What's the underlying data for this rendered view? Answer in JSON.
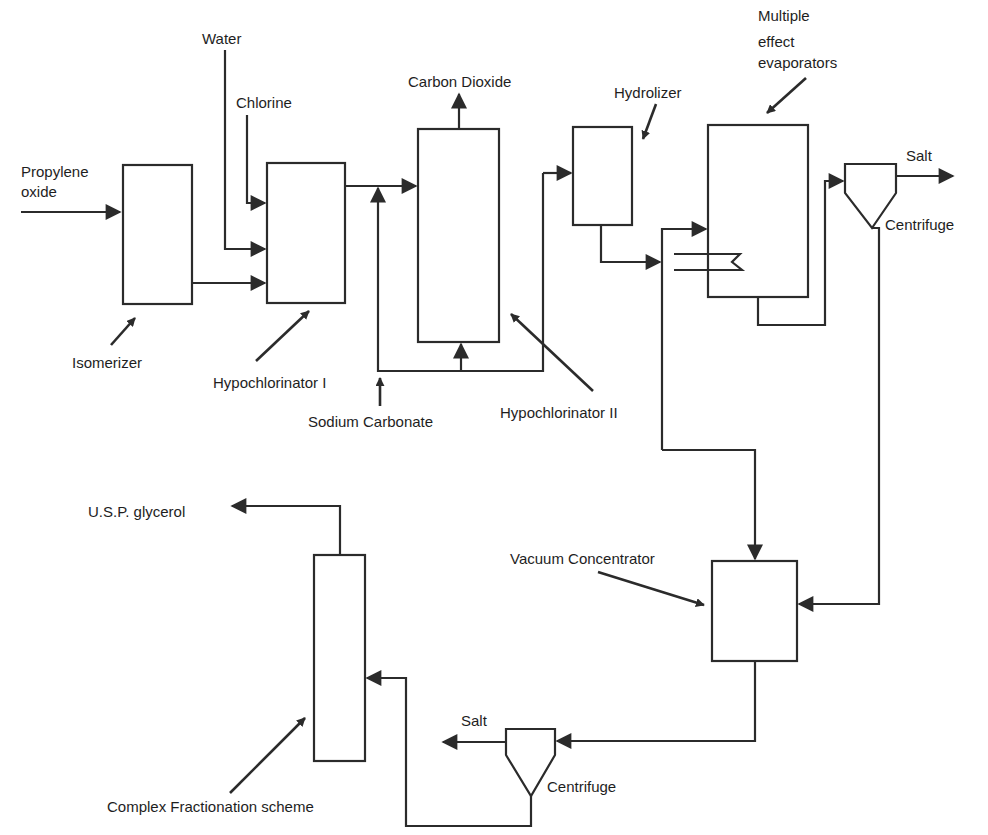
{
  "diagram": {
    "colors": {
      "line": "#2b2b2b",
      "text": "#1e1e1e",
      "background": "#ffffff"
    },
    "streams": {
      "propylene_oxide_line1": "Propylene",
      "propylene_oxide_line2": "oxide",
      "water": "Water",
      "chlorine": "Chlorine",
      "carbon_dioxide": "Carbon Dioxide",
      "sodium_carbonate": "Sodium Carbonate",
      "salt_top": "Salt",
      "salt_bottom": "Salt",
      "usp_glycerol": "U.S.P. glycerol"
    },
    "units": {
      "isomerizer": "Isomerizer",
      "hypochlorinator_1": "Hypochlorinator I",
      "hypochlorinator_2": "Hypochlorinator II",
      "hydrolizer": "Hydrolizer",
      "evaporators_line1": "Multiple",
      "evaporators_line2": "effect",
      "evaporators_line3": "evaporators",
      "centrifuge_top": "Centrifuge",
      "vacuum_concentrator": "Vacuum Concentrator",
      "centrifuge_bottom": "Centrifuge",
      "fractionation": "Complex Fractionation scheme"
    }
  }
}
